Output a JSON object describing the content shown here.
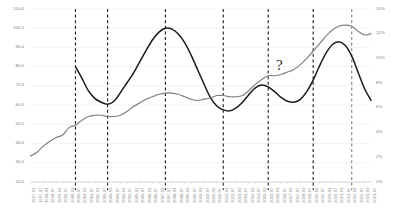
{
  "chart_data": {
    "type": "line",
    "title": "",
    "xlabel": "",
    "grid": true,
    "legend_position": "none",
    "axes": {
      "left": {
        "label": "",
        "ylim": [
          20.0,
          110.0
        ],
        "ticks": [
          "20.0",
          "30.0",
          "40.0",
          "50.0",
          "60.0",
          "70.0",
          "80.0",
          "90.0",
          "100.0",
          "110.0"
        ],
        "tick_values": [
          20,
          30,
          40,
          50,
          60,
          70,
          80,
          90,
          100,
          110
        ]
      },
      "right": {
        "label": "",
        "ylim": [
          0,
          14
        ],
        "ticks": [
          "0%",
          "2%",
          "4%",
          "6%",
          "8%",
          "10%",
          "12%",
          "14%"
        ],
        "tick_values": [
          0,
          2,
          4,
          6,
          8,
          10,
          12,
          14
        ]
      }
    },
    "x": [
      "1997-01",
      "1997-07",
      "1998-01",
      "1998-07",
      "1999-01",
      "1999-07",
      "2000-01",
      "2000-07",
      "2001-01",
      "2001-07",
      "2002-01",
      "2002-07",
      "2003-01",
      "2003-07",
      "2004-01",
      "2004-07",
      "2005-01",
      "2005-07",
      "2006-01",
      "2006-07",
      "2007-01",
      "2007-07",
      "2008-01",
      "2008-07",
      "2009-01",
      "2009-07",
      "2010-01",
      "2010-07",
      "2011-01",
      "2011-07",
      "2012-01",
      "2012-07",
      "2013-01",
      "2013-07",
      "2014-01",
      "2014-07",
      "2015-01",
      "2015-07",
      "2016-01",
      "2016-07",
      "2017-01",
      "2017-07",
      "2018-01",
      "2018-07",
      "2019-01",
      "2019-07",
      "2020-01",
      "2020-07",
      "2021-01",
      "2021-07",
      "2022-01",
      "2022-07",
      "2023-01",
      "2023-07"
    ],
    "x_tick_labels": [
      "1997-01",
      "1997-07",
      "1998-01",
      "1998-07",
      "1999-01",
      "1999-07",
      "2000-01",
      "2000-07",
      "2001-01",
      "2001-07",
      "2002-01",
      "2002-07",
      "2003-01",
      "2003-07",
      "2004-01",
      "2004-07",
      "2005-01",
      "2005-07",
      "2006-01",
      "2006-07",
      "2007-01",
      "2007-07",
      "2008-01",
      "2008-07",
      "2009-01",
      "2009-07",
      "2010-01",
      "2010-07",
      "2011-01",
      "2011-07",
      "2012-01",
      "2012-07",
      "2013-01",
      "2013-07",
      "2014-01",
      "2014-07",
      "2015-01",
      "2015-07",
      "2016-01",
      "2016-07",
      "2017-01",
      "2017-07",
      "2018-01",
      "2018-07",
      "2019-01",
      "2019-07",
      "2020-01",
      "2020-07",
      "2021-01",
      "2021-07",
      "2022-01",
      "2022-07",
      "2023-01",
      "2023-07"
    ],
    "series": [
      {
        "name": "black-series",
        "axis": "left",
        "color": "#1a1a1a",
        "width": 1.5,
        "start_index": 7,
        "values": [
          null,
          null,
          null,
          null,
          null,
          null,
          null,
          80.0,
          74.0,
          67.5,
          63.5,
          61.5,
          60.5,
          62.0,
          66.5,
          71.5,
          76.5,
          82.5,
          88.5,
          94.0,
          98.0,
          100.0,
          99.5,
          97.0,
          92.5,
          86.0,
          78.5,
          71.0,
          64.0,
          59.5,
          57.5,
          57.0,
          58.5,
          61.5,
          65.5,
          69.0,
          70.5,
          69.5,
          67.0,
          64.0,
          62.0,
          61.5,
          63.0,
          67.0,
          73.0,
          80.5,
          87.0,
          91.5,
          93.0,
          91.0,
          85.5,
          77.0,
          68.5,
          62.5
        ]
      },
      {
        "name": "gray-series",
        "axis": "right",
        "color": "#808080",
        "width": 1.2,
        "start_index": 0,
        "values": [
          2.1,
          2.4,
          2.9,
          3.3,
          3.6,
          3.8,
          4.4,
          4.6,
          5.0,
          5.3,
          5.4,
          5.4,
          5.3,
          5.3,
          5.4,
          5.7,
          6.1,
          6.4,
          6.7,
          6.9,
          7.1,
          7.2,
          7.2,
          7.1,
          6.9,
          6.7,
          6.6,
          6.7,
          6.8,
          7.0,
          7.0,
          6.9,
          6.9,
          7.0,
          7.4,
          7.9,
          8.3,
          8.6,
          8.6,
          8.7,
          8.9,
          9.1,
          9.5,
          10.0,
          10.6,
          11.2,
          11.8,
          12.3,
          12.6,
          12.7,
          12.6,
          12.2,
          11.9,
          12.0
        ]
      }
    ],
    "vertical_markers": [
      {
        "name": "marker-1",
        "x_index": 7,
        "style": "dashed",
        "color": "#1a1a1a"
      },
      {
        "name": "marker-2",
        "x_index": 12,
        "style": "dashed",
        "color": "#1a1a1a"
      },
      {
        "name": "marker-3",
        "x_index": 21,
        "style": "dashed",
        "color": "#1a1a1a"
      },
      {
        "name": "marker-4",
        "x_index": 30,
        "style": "dashed",
        "color": "#1a1a1a"
      },
      {
        "name": "marker-5",
        "x_index": 37,
        "style": "dashed",
        "color": "#1a1a1a"
      },
      {
        "name": "marker-6",
        "x_index": 44,
        "style": "dashed",
        "color": "#1a1a1a"
      },
      {
        "name": "marker-7",
        "x_index": 50,
        "style": "dashed",
        "color": "#808080"
      }
    ],
    "annotations": [
      {
        "name": "question-mark",
        "text": "?",
        "x_px": 276,
        "y_px": 58
      }
    ]
  }
}
